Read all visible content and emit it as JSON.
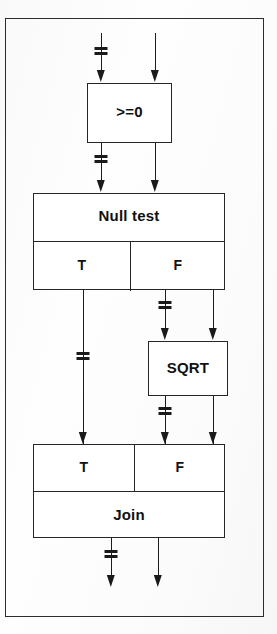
{
  "figure": {
    "background_color": "#ffffff",
    "line_color": "#1a1a1a",
    "frame_color": "#2c2c2c"
  },
  "blocks": {
    "compare": {
      "label": ">=0",
      "name": "greater-equal-zero-block"
    },
    "null_test": {
      "label": "Null test",
      "true_label": "T",
      "false_label": "F"
    },
    "sqrt": {
      "label": "SQRT"
    },
    "join": {
      "label": "Join",
      "true_label": "T",
      "false_label": "F"
    }
  },
  "markers": {
    "bus_symbol": "bus-tick-marker",
    "arrow_symbol": "arrowhead-down"
  },
  "signals": {
    "top_left": "data-bus-in",
    "top_right": "control-in",
    "compare_out_left": "data-bus",
    "compare_out_right": "control",
    "null_true_out": "data-bus",
    "null_false_out": "data-bus",
    "sqrt_in_control": "control",
    "sqrt_out_left": "data-bus",
    "sqrt_out_right": "control",
    "join_out_left": "data-bus",
    "join_out_right": "control"
  }
}
